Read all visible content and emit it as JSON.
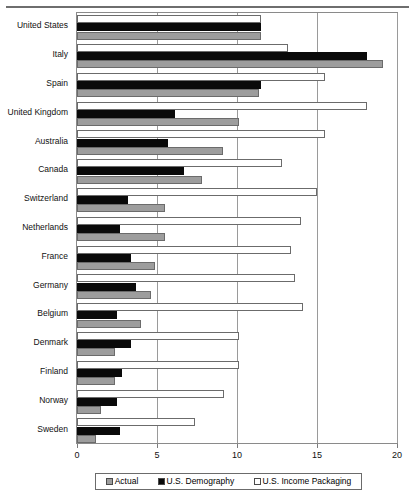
{
  "chart_data": {
    "type": "bar",
    "orientation": "horizontal",
    "title": "",
    "subtitle": "",
    "xlabel": "",
    "ylabel": "",
    "xlim": [
      0,
      20
    ],
    "xticks": [
      0,
      5,
      10,
      15,
      20
    ],
    "xtick_labels": [
      "0",
      "5",
      "10",
      "15",
      "20"
    ],
    "grid": true,
    "grid_axis": "x",
    "legend_position": "bottom",
    "categories": [
      "United States",
      "Italy",
      "Spain",
      "United Kingdom",
      "Australia",
      "Canada",
      "Switzerland",
      "Netherlands",
      "France",
      "Germany",
      "Belgium",
      "Denmark",
      "Finland",
      "Norway",
      "Sweden"
    ],
    "series": [
      {
        "name": "U.S. Income Packaging",
        "color": "#ffffff",
        "values": [
          11.5,
          13.2,
          15.5,
          18.1,
          15.5,
          12.8,
          15.0,
          14.0,
          13.4,
          13.6,
          14.1,
          10.1,
          10.1,
          9.2,
          7.4
        ]
      },
      {
        "name": "U.S. Demography",
        "color": "#0a0a0a",
        "values": [
          11.5,
          18.1,
          11.5,
          6.1,
          5.7,
          6.7,
          3.2,
          2.7,
          3.4,
          3.7,
          2.5,
          3.4,
          2.8,
          2.5,
          2.7
        ]
      },
      {
        "name": "Actual",
        "color": "#9d9d9d",
        "values": [
          11.5,
          19.1,
          11.4,
          10.1,
          9.1,
          7.8,
          5.5,
          5.5,
          4.9,
          4.6,
          4.0,
          2.4,
          2.4,
          1.5,
          1.2
        ]
      }
    ]
  },
  "legend": {
    "entries": [
      {
        "label": "Actual",
        "swatch": "actual"
      },
      {
        "label": "U.S. Demography",
        "swatch": "demography"
      },
      {
        "label": "U.S. Income Packaging",
        "swatch": "income-packaging"
      }
    ]
  },
  "colors": {
    "actual": "#9d9d9d",
    "demography": "#0a0a0a",
    "income_packaging": "#ffffff",
    "axis": "#8a8a8a",
    "grid": "#9a9a9a",
    "text": "#111111"
  }
}
